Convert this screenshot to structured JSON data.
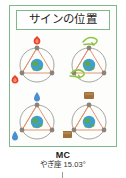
{
  "figure": {
    "title": "サインの位置",
    "caption": {
      "label": "MC",
      "position": "やぎ座 15.03°"
    },
    "colors": {
      "frame": "#7fb98a",
      "title_border": "#7fb98a",
      "orbit_circle": "#9a9a96",
      "triangle": "#e08a62",
      "node": "#8c8279",
      "earth_ocean": "#3f9fd4",
      "earth_land": "#5aa84f",
      "fire": "#e8432a",
      "air": "#8cc63f",
      "water": "#4a8fd0",
      "soil": "#a0703a",
      "background": "#ffffff"
    },
    "cells": [
      {
        "id": "fire-quadrant",
        "element": "fire",
        "icon": "flame-icon",
        "icon_color": "#e8432a",
        "icon_count": 2,
        "center_body": "earth-globe",
        "shape": "triangle",
        "node_count": 3
      },
      {
        "id": "air-quadrant",
        "element": "air",
        "icon": "wind-swirl-icon",
        "icon_color": "#8cc63f",
        "icon_count": 2,
        "center_body": "earth-globe",
        "shape": "triangle",
        "node_count": 3
      },
      {
        "id": "water-quadrant",
        "element": "water",
        "icon": "water-drop-icon",
        "icon_color": "#4a8fd0",
        "icon_count": 2,
        "center_body": "earth-globe",
        "shape": "triangle",
        "node_count": 3
      },
      {
        "id": "earth-quadrant",
        "element": "earth",
        "icon": "soil-block-icon",
        "icon_color": "#a0703a",
        "icon_count": 2,
        "center_body": "earth-globe",
        "shape": "triangle",
        "node_count": 3
      }
    ]
  }
}
